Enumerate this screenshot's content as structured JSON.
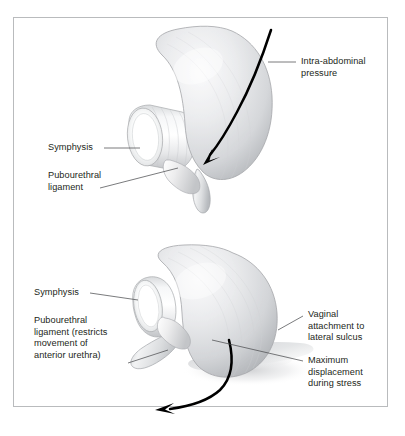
{
  "figure": {
    "background_color": "#ffffff",
    "border_color": "#b9bbbd",
    "text_color": "#231f20",
    "anatomy_fill_light": "#f7f7f8",
    "anatomy_fill_mid": "#dcdddf",
    "anatomy_fill_dark": "#b4b6b9",
    "outline_color": "#9a9c9f",
    "arrow_color": "#000000",
    "leader_color": "#4d4f52"
  },
  "panels": [
    {
      "id": "top-panel",
      "name": "resting-position-panel",
      "labels": [
        {
          "id": "intra-abdominal-pressure",
          "text": "Intra-abdominal\npressure",
          "align": "left"
        },
        {
          "id": "symphysis-top",
          "text": "Symphysis",
          "align": "right"
        },
        {
          "id": "pubourethral-ligament-top",
          "text": "Pubourethral\nligament",
          "align": "right"
        }
      ]
    },
    {
      "id": "bottom-panel",
      "name": "stress-displacement-panel",
      "labels": [
        {
          "id": "symphysis-bottom",
          "text": "Symphysis",
          "align": "right"
        },
        {
          "id": "pubourethral-ligament-bottom",
          "text": "Pubourethral\nligament (restricts\nmovement of\nanterior urethra)",
          "align": "right"
        },
        {
          "id": "vaginal-attachment",
          "text": "Vaginal\nattachment to\nlateral sulcus",
          "align": "left"
        },
        {
          "id": "maximum-displacement",
          "text": "Maximum\ndisplacement\nduring stress",
          "align": "left"
        }
      ]
    }
  ]
}
